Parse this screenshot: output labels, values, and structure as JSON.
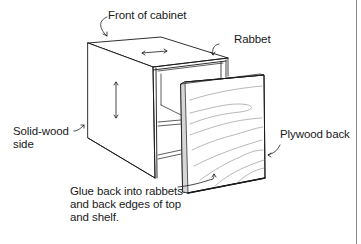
{
  "figure": {
    "labels": {
      "front": "Front of cabinet",
      "rabbet": "Rabbet",
      "side": "Solid-wood\nside",
      "back": "Plywood back",
      "glue": "Glue back into rabbets\nand back edges of top\nand shelf."
    },
    "annotations": [
      {
        "id": "front",
        "text": "Front of cabinet",
        "points_to": "front top edge of cabinet"
      },
      {
        "id": "rabbet",
        "text": "Rabbet",
        "points_to": "rabbet cut in back edge of side"
      },
      {
        "id": "side",
        "text": "Solid-wood side",
        "points_to": "left side panel"
      },
      {
        "id": "back",
        "text": "Plywood back",
        "points_to": "right edge of plywood back panel"
      },
      {
        "id": "glue",
        "text": "Glue back into rabbets and back edges of top and shelf.",
        "points_to": "plywood back panel"
      }
    ],
    "grain_arrows": [
      "horizontal arrow on top panel",
      "vertical arrow on side panel"
    ],
    "colors": {
      "line": "#1a1a1a",
      "panel_edge": "#bdbdbd",
      "wood_grain": "#9a9a9a",
      "rule": "#8a8a8a"
    }
  }
}
